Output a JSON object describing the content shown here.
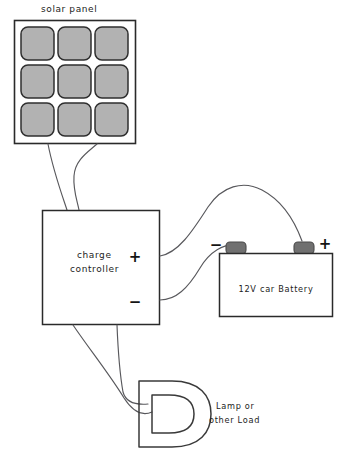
{
  "diagram": {
    "background_color": "#ffffff",
    "ink_color": "#2a2a2a",
    "wire_color": "#58585c"
  },
  "solar_panel": {
    "label": "solar panel",
    "cell_count": 9,
    "grid": "3x3",
    "cell_fill": "#b2b2b2",
    "cell_border": "#2f2f2f",
    "frame_color": "#2a2a2a"
  },
  "charge_controller": {
    "label_line1": "charge",
    "label_line2": "controller",
    "positive_terminal": "+",
    "negative_terminal": "−"
  },
  "battery": {
    "label": "12V car Battery",
    "negative_terminal": "−",
    "positive_terminal": "+",
    "post_fill": "#707070",
    "body_fill": "#ffffff"
  },
  "load": {
    "label_line1": "Lamp or",
    "label_line2": "other Load",
    "shape": "horseshoe-lamp"
  },
  "wires": {
    "panel_to_controller_count": 2,
    "controller_to_battery_count": 2,
    "controller_to_load_count": 2,
    "color": "#58585c"
  }
}
